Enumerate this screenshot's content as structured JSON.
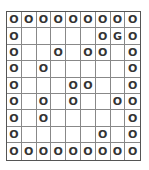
{
  "board": {
    "rows": 9,
    "cols": 9,
    "grid": [
      [
        "O",
        "O",
        "O",
        "O",
        "O",
        "O",
        "O",
        "O",
        "O"
      ],
      [
        "O",
        "",
        "",
        "",
        "",
        "",
        "O",
        "G",
        "O"
      ],
      [
        "O",
        "",
        "",
        "O",
        "",
        "O",
        "O",
        "",
        "O"
      ],
      [
        "O",
        "",
        "O",
        "",
        "",
        "",
        "",
        "",
        "O"
      ],
      [
        "O",
        "",
        "",
        "",
        "O",
        "O",
        "",
        "",
        "O"
      ],
      [
        "O",
        "",
        "O",
        "",
        "O",
        "",
        "",
        "O",
        "O"
      ],
      [
        "O",
        "",
        "O",
        "",
        "",
        "",
        "",
        "",
        "O"
      ],
      [
        "O",
        "",
        "",
        "",
        "",
        "",
        "O",
        "",
        "O"
      ],
      [
        "O",
        "O",
        "O",
        "O",
        "O",
        "O",
        "O",
        "O",
        "O"
      ]
    ],
    "legend": {
      "O": "wall",
      "G": "goal",
      "": "empty"
    }
  }
}
